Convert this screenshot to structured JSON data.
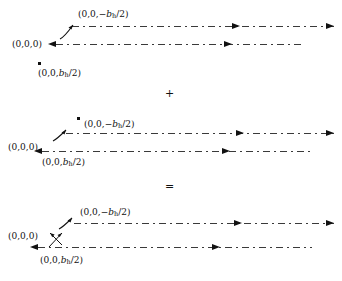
{
  "figure": {
    "background_color": "#ffffff",
    "line_color": "#3a3a3a",
    "ink_color": "#111111",
    "width": 342,
    "height": 281
  },
  "operators": {
    "plus": "+",
    "equals": "="
  },
  "labels": {
    "origin": "(0,0,0)",
    "upper_prefix": "(0,0,−",
    "lower_prefix": "(0,0,",
    "b_symbol": "b",
    "b_subscript": "h",
    "half_suffix": "/2)"
  },
  "panels": [
    {
      "id": "panel-top",
      "name": "first-dislocation-dipole",
      "origin_label": "(0,0,0)",
      "upper_line_label": "(0,0,−b_h/2)",
      "lower_line_label": "(0,0,b_h/2)",
      "upper_line": {
        "y": 26,
        "x_start": 72,
        "x_end": 334,
        "mid_arrow_x": 232,
        "mid_arrow_dir": "right",
        "end_arrow_dir": "right",
        "start_arrow_dir": "none"
      },
      "lower_line": {
        "y": 44,
        "x_start": 56,
        "x_end": 305,
        "mid_arrow_x": 224,
        "mid_arrow_dir": "right",
        "end_arrow_dir": "none",
        "start_arrow_dir": "left"
      },
      "dot": {
        "x": 38,
        "y": 62
      },
      "leader": "curved-up-right"
    },
    {
      "id": "panel-middle",
      "name": "second-dislocation-dipole",
      "origin_label": "(0,0,0)",
      "upper_line_label": "(0,0,−b_h/2)",
      "lower_line_label": "(0,0,b_h/2)",
      "upper_line": {
        "y": 133,
        "x_start": 66,
        "x_end": 334,
        "mid_arrow_x": 236,
        "mid_arrow_dir": "right",
        "end_arrow_dir": "right",
        "start_arrow_dir": "none"
      },
      "lower_line": {
        "y": 151,
        "x_start": 42,
        "x_end": 312,
        "mid_arrow_x": 222,
        "mid_arrow_dir": "right",
        "end_arrow_dir": "none",
        "start_arrow_dir": "left"
      },
      "dot": {
        "x": 77,
        "y": 117
      },
      "leader": "curved-up-right"
    },
    {
      "id": "panel-bottom",
      "name": "resultant-dislocation-dipole",
      "origin_label": "(0,0,0)",
      "upper_line_label": "(0,0,−b_h/2)",
      "lower_line_label": "(0,0,b_h/2)",
      "upper_line": {
        "y": 223,
        "x_start": 74,
        "x_end": 334,
        "mid_arrow_x": 234,
        "mid_arrow_dir": "right",
        "end_arrow_dir": "right",
        "start_arrow_dir": "none"
      },
      "lower_line": {
        "y": 247,
        "x_start": 38,
        "x_end": 312,
        "mid_arrow_x": 212,
        "mid_arrow_dir": "right",
        "end_arrow_dir": "none",
        "start_arrow_dir": "left"
      },
      "dot": null,
      "leader": "crossed-double"
    }
  ]
}
